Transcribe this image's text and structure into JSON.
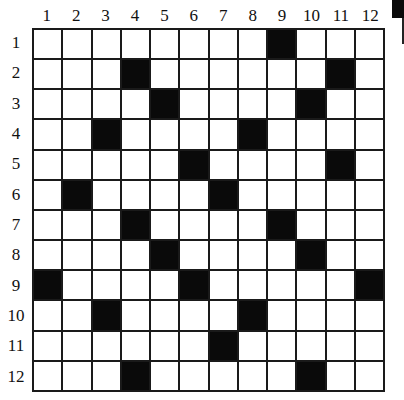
{
  "puzzle": {
    "rows": 12,
    "cols": 12,
    "column_labels": [
      "1",
      "2",
      "3",
      "4",
      "5",
      "6",
      "7",
      "8",
      "9",
      "10",
      "11",
      "12"
    ],
    "row_labels": [
      "1",
      "2",
      "3",
      "4",
      "5",
      "6",
      "7",
      "8",
      "9",
      "10",
      "11",
      "12"
    ],
    "black_cells": [
      [
        1,
        9
      ],
      [
        2,
        4
      ],
      [
        2,
        11
      ],
      [
        3,
        5
      ],
      [
        3,
        10
      ],
      [
        4,
        3
      ],
      [
        4,
        8
      ],
      [
        5,
        6
      ],
      [
        5,
        11
      ],
      [
        6,
        2
      ],
      [
        6,
        7
      ],
      [
        7,
        4
      ],
      [
        7,
        9
      ],
      [
        8,
        5
      ],
      [
        8,
        10
      ],
      [
        9,
        1
      ],
      [
        9,
        6
      ],
      [
        9,
        12
      ],
      [
        10,
        3
      ],
      [
        10,
        8
      ],
      [
        11,
        7
      ],
      [
        12,
        4
      ],
      [
        12,
        10
      ]
    ],
    "colors": {
      "black_cell": "#0a0a0a",
      "white_cell": "#ffffff",
      "grid_line": "#1a1a1a"
    }
  }
}
